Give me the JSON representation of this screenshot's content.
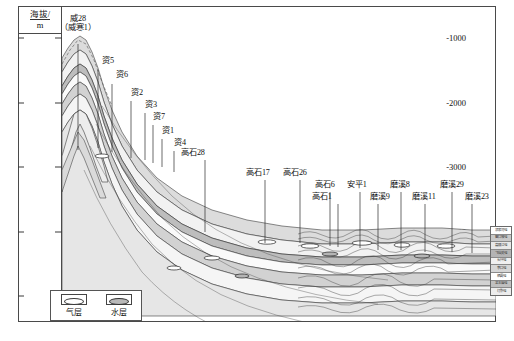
{
  "figure": {
    "type": "geological-cross-section",
    "axis": {
      "title_line1": "海拔/",
      "title_line2": "m",
      "ticks": [
        "-1000",
        "-2000",
        "-3000",
        "-4000",
        "-5000"
      ],
      "tick_values": [
        -1000,
        -2000,
        -3000,
        -4000,
        -5000
      ],
      "range_top": -500,
      "range_bottom": -5400
    },
    "legend": {
      "items": [
        {
          "label": "气层",
          "symbol": "gas-lens"
        },
        {
          "label": "水层",
          "symbol": "water-lens"
        }
      ]
    },
    "wells": [
      {
        "name": "威28\n（威寒1）",
        "label_top": "威28",
        "label_bottom": "（威寒1）",
        "x": 78,
        "label_x": 78,
        "label_y": 14,
        "line_top": 44,
        "line_bottom": 150
      },
      {
        "name": "资5",
        "label_x": 108,
        "label_y": 56,
        "x": 98,
        "line_top": 70,
        "line_bottom": 148
      },
      {
        "name": "资6",
        "label_x": 122,
        "label_y": 70,
        "x": 112,
        "line_top": 84,
        "line_bottom": 152
      },
      {
        "name": "资2",
        "label_x": 137,
        "label_y": 88,
        "x": 131,
        "line_top": 101,
        "line_bottom": 158
      },
      {
        "name": "资3",
        "label_x": 151,
        "label_y": 100,
        "x": 145,
        "line_top": 113,
        "line_bottom": 160
      },
      {
        "name": "资7",
        "label_x": 159,
        "label_y": 112,
        "x": 153,
        "line_top": 125,
        "line_bottom": 163
      },
      {
        "name": "资1",
        "label_x": 168,
        "label_y": 126,
        "x": 162,
        "line_top": 139,
        "line_bottom": 167
      },
      {
        "name": "资4",
        "label_x": 180,
        "label_y": 138,
        "x": 174,
        "line_top": 151,
        "line_bottom": 172
      },
      {
        "name": "高石28",
        "label_x": 193,
        "label_y": 148,
        "x": 205,
        "line_top": 160,
        "line_bottom": 232
      },
      {
        "name": "高石17",
        "label_x": 258,
        "label_y": 168,
        "x": 265,
        "line_top": 180,
        "line_bottom": 243
      },
      {
        "name": "高石26",
        "label_x": 295,
        "label_y": 168,
        "x": 300,
        "line_top": 180,
        "line_bottom": 243
      },
      {
        "name": "高石6",
        "label_x": 325,
        "label_y": 180,
        "x": 330,
        "line_top": 192,
        "line_bottom": 246
      },
      {
        "name": "高石1",
        "label_x": 322,
        "label_y": 192,
        "x": 338,
        "line_top": 204,
        "line_bottom": 247
      },
      {
        "name": "安平1",
        "label_x": 357,
        "label_y": 180,
        "x": 360,
        "line_top": 192,
        "line_bottom": 248
      },
      {
        "name": "磨溪9",
        "label_x": 380,
        "label_y": 192,
        "x": 378,
        "line_top": 204,
        "line_bottom": 250
      },
      {
        "name": "磨溪8",
        "label_x": 400,
        "label_y": 180,
        "x": 401,
        "line_top": 192,
        "line_bottom": 250
      },
      {
        "name": "磨溪11",
        "label_x": 424,
        "label_y": 192,
        "x": 425,
        "line_top": 204,
        "line_bottom": 252
      },
      {
        "name": "磨溪29",
        "label_x": 452,
        "label_y": 180,
        "x": 452,
        "line_top": 192,
        "line_bottom": 252
      },
      {
        "name": "磨溪23",
        "label_x": 477,
        "label_y": 192,
        "x": 472,
        "line_top": 204,
        "line_bottom": 253
      }
    ],
    "strat_column": {
      "cells": [
        "须家河组",
        "雷口坡组",
        "嘉陵江组",
        "飞仙关组",
        "长兴组",
        "茅口组",
        "栖霞组",
        "龙王庙组",
        "灯影组"
      ]
    }
  }
}
